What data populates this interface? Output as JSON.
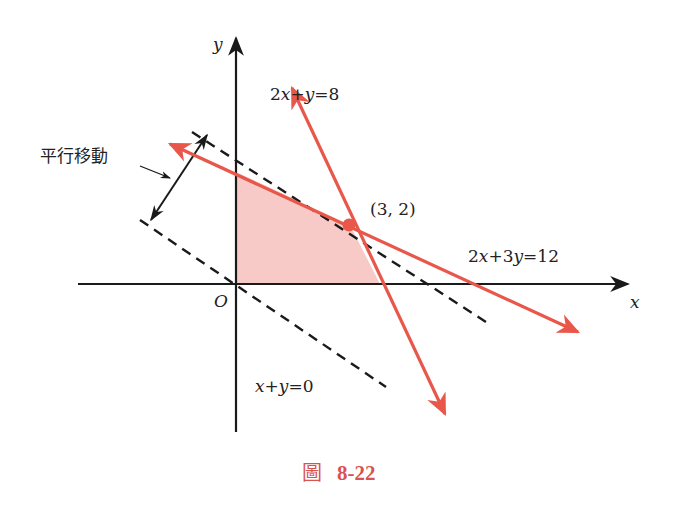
{
  "figure": {
    "caption_prefix": "圖",
    "caption_number": "8-22",
    "colors": {
      "axis": "#1a1a1a",
      "constraint_line": "#e8574a",
      "feasible_region": "#f7c9c7",
      "dashed_line": "#1a1a1a",
      "caption": "#d9534f"
    }
  },
  "axes": {
    "x_label": "x",
    "y_label": "y",
    "origin_label": "O",
    "origin_px": [
      236,
      284
    ],
    "unit_px": [
      38,
      29.5
    ]
  },
  "lines": [
    {
      "id": "constraint-1",
      "label": "2x+y=8",
      "label_parts": [
        "2",
        "x",
        "+",
        "y",
        "=8"
      ],
      "style": "solid-arrow-both"
    },
    {
      "id": "constraint-2",
      "label": "2x+3y=12",
      "label_parts": [
        "2",
        "x",
        "+3",
        "y",
        "=12"
      ],
      "style": "solid-arrow-both"
    },
    {
      "id": "objective-0",
      "label": "x+y=0",
      "label_parts": [
        "x",
        "+",
        "y",
        "=0"
      ],
      "style": "dashed"
    },
    {
      "id": "objective-max",
      "label": "x+y=5",
      "style": "dashed"
    }
  ],
  "points": [
    {
      "label": "(3, 2)",
      "x": 3,
      "y": 2
    }
  ],
  "feasible_region": {
    "vertices": [
      [
        0,
        0
      ],
      [
        0,
        4
      ],
      [
        3,
        2
      ],
      [
        4,
        0
      ]
    ]
  },
  "annotations": {
    "translation_label": "平行移動"
  }
}
